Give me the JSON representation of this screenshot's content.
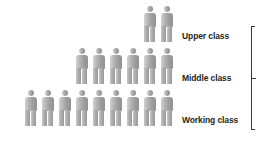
{
  "chart_data": {
    "type": "bar",
    "title": "",
    "subtitle": "",
    "xlabel": "",
    "ylabel": "",
    "categories": [
      "Upper class",
      "Middle class",
      "Working class"
    ],
    "values": [
      2,
      6,
      9
    ],
    "unit": "person pictogram = 1 unit",
    "orientation": "horizontal-pictogram",
    "legend_position": "none",
    "grid": false,
    "annotations": [
      "right brace spanning all three classes"
    ],
    "series": [
      {
        "name": "Number of people",
        "values": [
          2,
          6,
          9
        ]
      }
    ],
    "rows": [
      {
        "id": "upper",
        "label": "Upper class",
        "count": 2,
        "align": "right"
      },
      {
        "id": "middle",
        "label": "Middle class",
        "count": 6,
        "align": "right"
      },
      {
        "id": "working",
        "label": "Working class",
        "count": 9,
        "align": "right"
      }
    ]
  },
  "colors": {
    "background": "#ffffff",
    "figure_light": "#d2d2d2",
    "figure_mid": "#b0b0b0",
    "figure_dark": "#929292",
    "text": "#231f20",
    "brace": "#3a3a3a"
  },
  "icons": {
    "person": "person-icon",
    "brace": "brace-icon"
  }
}
